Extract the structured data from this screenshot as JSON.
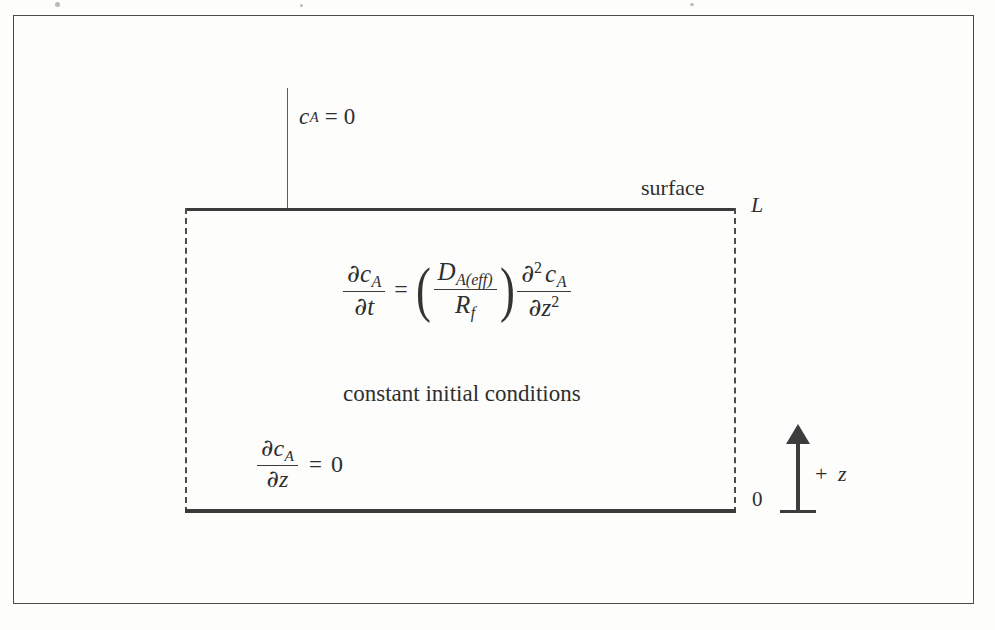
{
  "figure": {
    "kind": "one-dimensional diffusion domain schematic"
  },
  "domain_box": {
    "top_edge_name": "surface boundary",
    "bottom_edge_name": "impermeable base boundary"
  },
  "boundary_conditions": {
    "top": {
      "label": "c_A = 0",
      "concentration_symbol": "c",
      "species_subscript": "A",
      "equals": "=",
      "value": "0"
    },
    "bottom": {
      "label": "∂c_A/∂z = 0",
      "partial": "∂",
      "numerator_symbol": "c",
      "numerator_subscript": "A",
      "denominator_symbol": "z",
      "equals": "=",
      "value": "0"
    }
  },
  "governing_equation": {
    "lhs": {
      "partial": "∂",
      "numerator_symbol": "c",
      "numerator_subscript": "A",
      "denominator_symbol": "t"
    },
    "equals": "=",
    "coefficient": {
      "open_paren": "(",
      "numerator_symbol": "D",
      "numerator_subscript": "A(eff)",
      "denominator_symbol": "R",
      "denominator_subscript": "f",
      "close_paren": ")"
    },
    "rhs": {
      "partial": "∂",
      "order": "2",
      "numerator_symbol": "c",
      "numerator_subscript": "A",
      "denominator_symbol": "z",
      "denominator_exponent": "2"
    }
  },
  "interior_note": "constant initial conditions",
  "labels": {
    "surface": "surface",
    "top_coordinate": "L",
    "bottom_coordinate": "0"
  },
  "axis": {
    "direction_label": "+",
    "variable": "z"
  },
  "colors": {
    "ink": "#2e2e2e",
    "rule": "#3d3d3d",
    "dashed_edge": "#4b4b4b",
    "frame": "#4a4a4a",
    "page": "#fdfdfc"
  }
}
